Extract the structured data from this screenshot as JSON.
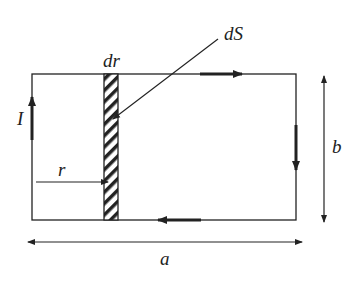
{
  "diagram": {
    "labels": {
      "current": "I",
      "strip_width": "dr",
      "area_element": "dS",
      "distance": "r",
      "width": "a",
      "height": "b"
    },
    "colors": {
      "line": "#222222",
      "background": "#ffffff"
    },
    "current_direction": [
      "up on left side",
      "right on top",
      "down on right side",
      "left on bottom"
    ]
  }
}
